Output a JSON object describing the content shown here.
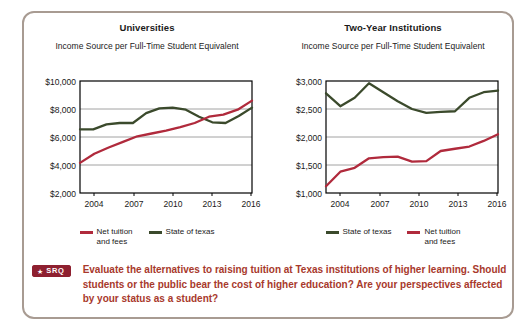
{
  "panel": {
    "srq": {
      "badge_star": "★",
      "badge_label": "SRQ",
      "prompt": "Evaluate the alternatives to raising tuition at Texas institutions of higher learning. Should students or the public bear the cost of higher education? Are your perspectives affected by your status as a student?",
      "badge_bg": "#8e2030",
      "text_color": "#a8392c"
    },
    "border_color": "#a89b92"
  },
  "colors": {
    "net_tuition": "#b02a3c",
    "state_of_texas": "#3b4a2c",
    "grid": "#8a8a8a",
    "axis": "#000000"
  },
  "chart_data": [
    {
      "type": "line",
      "title": "Universities",
      "subtitle": "Income Source per Full-Time\nStudent Equivalent",
      "xlabel": "",
      "ylabel": "",
      "x": [
        2004,
        2005,
        2006,
        2007,
        2008,
        2009,
        2010,
        2011,
        2012,
        2013,
        2014,
        2015,
        2016
      ],
      "xticks": [
        "2004",
        "2007",
        "2010",
        "2013",
        "2016"
      ],
      "yticks": [
        "$2,000",
        "$4,000",
        "$6,000",
        "$8,000",
        "$10,000"
      ],
      "ylim": [
        2000,
        10000
      ],
      "grid": true,
      "legend_position": "bottom",
      "series": [
        {
          "name": "Net tuition\nand fees",
          "legend_label": "Net tuition and fees",
          "color": "#b02a3c",
          "values": [
            4150,
            4800,
            5250,
            5650,
            6050,
            6250,
            6450,
            6700,
            7000,
            7450,
            7600,
            7950,
            8600
          ]
        },
        {
          "name": "State of texas",
          "legend_label": "State of texas",
          "color": "#3b4a2c",
          "values": [
            6550,
            6550,
            6900,
            7000,
            7000,
            7700,
            8050,
            8100,
            7950,
            7450,
            7050,
            7000,
            7500,
            8100
          ]
        }
      ],
      "legend_order": [
        "Net tuition and fees",
        "State of texas"
      ]
    },
    {
      "type": "line",
      "title": "Two-Year Institutions",
      "subtitle": "Income Source per Full-Time\nStudent Equivalent",
      "xlabel": "",
      "ylabel": "",
      "x": [
        2004,
        2005,
        2006,
        2007,
        2008,
        2009,
        2010,
        2011,
        2012,
        2013,
        2014,
        2015,
        2016
      ],
      "xticks": [
        "2004",
        "2007",
        "2010",
        "2013",
        "2016"
      ],
      "yticks": [
        "$1,000",
        "$1,500",
        "$2,000",
        "$2,500",
        "$3,000"
      ],
      "ylim": [
        1000,
        3000
      ],
      "grid": true,
      "legend_position": "bottom",
      "series": [
        {
          "name": "State of texas",
          "legend_label": "State of texas",
          "color": "#3b4a2c",
          "values": [
            2780,
            2550,
            2700,
            2960,
            2800,
            2640,
            2500,
            2430,
            2450,
            2460,
            2700,
            2800,
            2830
          ]
        },
        {
          "name": "Net tuition\nand fees",
          "legend_label": "Net tuition and fees",
          "color": "#b02a3c",
          "values": [
            1120,
            1380,
            1450,
            1620,
            1640,
            1650,
            1560,
            1570,
            1750,
            1790,
            1830,
            1930,
            2050
          ]
        }
      ],
      "legend_order": [
        "State of texas",
        "Net tuition and fees"
      ]
    }
  ]
}
